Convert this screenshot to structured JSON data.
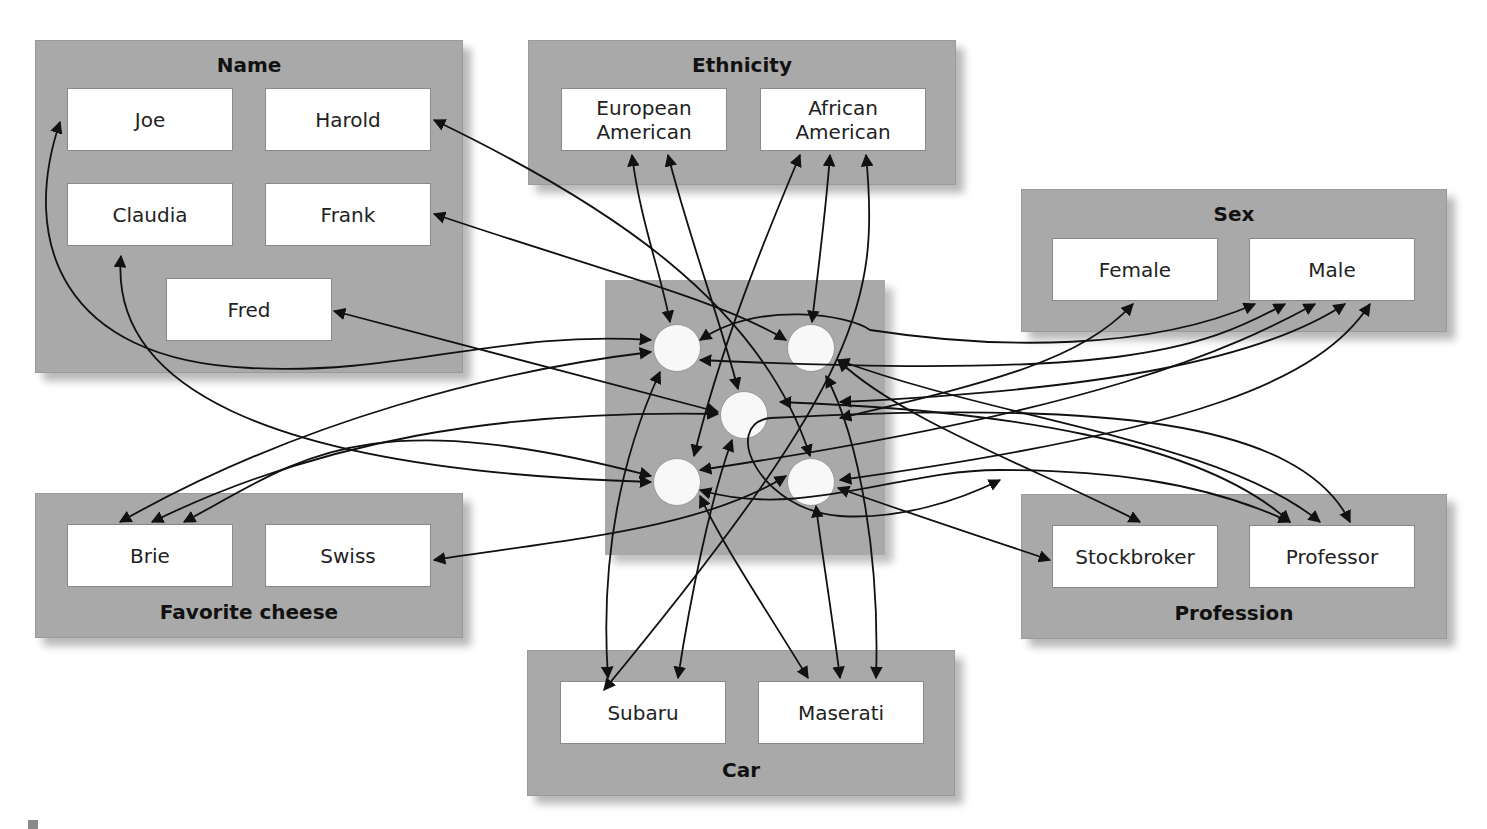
{
  "groups": {
    "name": {
      "title": "Name",
      "items": [
        "Joe",
        "Harold",
        "Claudia",
        "Frank",
        "Fred"
      ]
    },
    "ethnicity": {
      "title": "Ethnicity",
      "items": [
        "European American",
        "African American"
      ]
    },
    "sex": {
      "title": "Sex",
      "items": [
        "Female",
        "Male"
      ]
    },
    "cheese": {
      "title": "Favorite cheese",
      "items": [
        "Brie",
        "Swiss"
      ]
    },
    "profession": {
      "title": "Profession",
      "items": [
        "Stockbroker",
        "Professor"
      ]
    },
    "car": {
      "title": "Car",
      "items": [
        "Subaru",
        "Maserati"
      ]
    }
  },
  "hidden_units": {
    "count": 5,
    "labels": [
      "unit-1",
      "unit-2",
      "unit-3",
      "unit-4",
      "unit-5"
    ]
  },
  "colors": {
    "group_bg": "#a9a9a9",
    "node_bg": "#ffffff",
    "unit_bg": "#f8f8f8",
    "edge": "#111111"
  }
}
